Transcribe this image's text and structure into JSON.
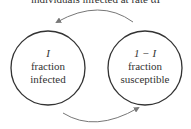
{
  "diagram": {
    "top_label": "individuals infected at rate αI",
    "nodes": [
      {
        "id": "infected",
        "symbol": "I",
        "line1": "fraction",
        "line2": "infected"
      },
      {
        "id": "susceptible",
        "symbol": "1 − I",
        "line1": "fraction",
        "line2": "susceptible"
      }
    ],
    "edges": [
      {
        "from": "susceptible",
        "to": "infected",
        "position": "top"
      },
      {
        "from": "infected",
        "to": "susceptible",
        "position": "bottom"
      }
    ],
    "colors": {
      "stroke": "#333333",
      "arrow": "#777777",
      "background": "#ffffff"
    }
  }
}
